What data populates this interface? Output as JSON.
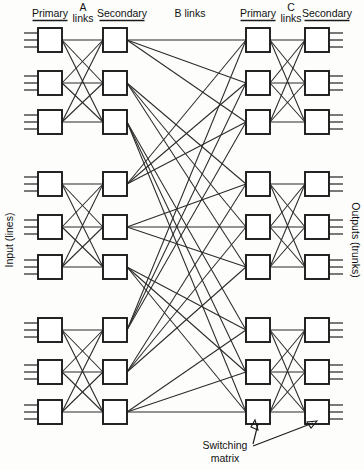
{
  "diagram": {
    "headers": [
      {
        "id": "primary-left",
        "text": "Primary",
        "x": 50,
        "y": 17,
        "anchor": "middle",
        "underline": true
      },
      {
        "id": "a-links",
        "text": "A",
        "x": 83,
        "y": 11,
        "anchor": "middle",
        "underline": false
      },
      {
        "id": "a-links-2",
        "text": "links",
        "x": 83,
        "y": 22,
        "anchor": "middle",
        "underline": false
      },
      {
        "id": "secondary-left",
        "text": "Secondary",
        "x": 122,
        "y": 17,
        "anchor": "middle",
        "underline": true
      },
      {
        "id": "b-links",
        "text": "B links",
        "x": 190,
        "y": 17,
        "anchor": "middle",
        "underline": false
      },
      {
        "id": "primary-right",
        "text": "Primary",
        "x": 258,
        "y": 17,
        "anchor": "middle",
        "underline": true
      },
      {
        "id": "c-links",
        "text": "C",
        "x": 291,
        "y": 11,
        "anchor": "middle",
        "underline": false
      },
      {
        "id": "c-links-2",
        "text": "links",
        "x": 291,
        "y": 22,
        "anchor": "middle",
        "underline": false
      },
      {
        "id": "secondary-right",
        "text": "Secondary",
        "x": 327,
        "y": 17,
        "anchor": "middle",
        "underline": true
      }
    ],
    "side_labels": {
      "left": "Input (lines)",
      "right": "Outputs (trunks)"
    },
    "callout": {
      "line1": "Switching",
      "line2": "matrix"
    },
    "columns": [
      {
        "id": "primary-left",
        "x": 38
      },
      {
        "id": "secondary-left",
        "x": 103
      },
      {
        "id": "primary-right",
        "x": 246
      },
      {
        "id": "secondary-right",
        "x": 305
      }
    ],
    "box": {
      "w": 24,
      "h": 24
    },
    "rows": [
      28,
      71,
      110,
      172,
      215,
      255,
      318,
      360,
      400
    ],
    "groups": [
      [
        0,
        1,
        2
      ],
      [
        3,
        4,
        5
      ],
      [
        6,
        7,
        8
      ]
    ],
    "stubs_per_box": 3,
    "colors": {
      "line": "#2a2a2a",
      "box_stroke": "#1a1a1a",
      "box_fill": "#ffffff",
      "background": "#fdfdfc",
      "text": "#111111"
    }
  }
}
